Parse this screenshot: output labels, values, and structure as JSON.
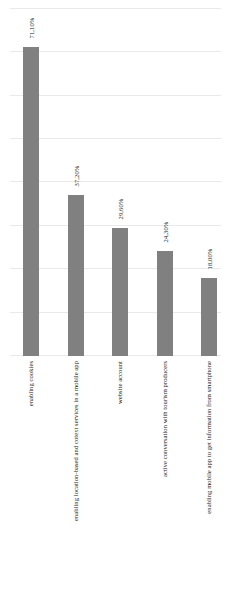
{
  "chart_data": {
    "type": "bar",
    "title": "",
    "subtitle": "",
    "xlabel": "",
    "ylabel": "",
    "categories": [
      "enabling cookies",
      "enabling location-based and cotext services in a mobile app",
      "website account",
      "active conversation with tourism producers",
      "enabling mobile app to get information from smartphone"
    ],
    "values": [
      71.1,
      37.2,
      29.6,
      24.3,
      18.0
    ],
    "value_labels": [
      "71,10%",
      "37,20%",
      "29,60%",
      "24,30%",
      "18,00%"
    ],
    "ylim": [
      0,
      82
    ],
    "grid": true,
    "gridlines": [
      0,
      10,
      20,
      30,
      40,
      50,
      60,
      70,
      80
    ],
    "legend": "none",
    "legend_position": "none",
    "bar_color": "#808080",
    "gridline_color": "#e9e9e9",
    "background_color": "#ffffff",
    "orientation": "vertical",
    "label_rotation_deg": 90
  },
  "chart": {
    "bars": [
      {
        "label": "enabling cookies",
        "value_label": "71,10%"
      },
      {
        "label": "enabling location-based and cotext services in a mobile app",
        "value_label": "37,20%"
      },
      {
        "label": "website account",
        "value_label": "29,60%"
      },
      {
        "label": "active conversation with tourism producers",
        "value_label": "24,30%"
      },
      {
        "label": "enabling mobile app to get information from smartphone",
        "value_label": "18,00%"
      }
    ]
  }
}
